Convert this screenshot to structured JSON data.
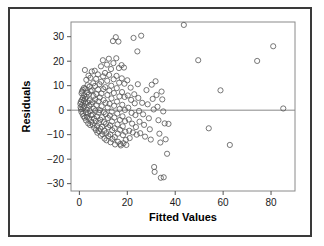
{
  "figure": {
    "frame_color": "#3a3a3a",
    "background": "#ffffff"
  },
  "chart_data": {
    "type": "scatter",
    "title": "",
    "xlabel": "Fitted Values",
    "ylabel": "Residuals",
    "xlim": [
      -3.5,
      90
    ],
    "ylim": [
      -33,
      36
    ],
    "xticks": [
      0,
      20,
      40,
      60,
      80
    ],
    "xtick_labels": [
      "0",
      "20",
      "40",
      "60",
      "80"
    ],
    "yticks": [
      -30,
      -20,
      -10,
      0,
      10,
      20,
      30
    ],
    "ytick_labels": [
      "−30",
      "−20",
      "−10",
      "0",
      "10",
      "20",
      "30"
    ],
    "grid": false,
    "legend": "none",
    "marker": "open-circle",
    "marker_color": "#555555",
    "marker_size": 2.6,
    "reference_line": {
      "orientation": "horizontal",
      "y": 0,
      "color": "#888888"
    },
    "points": [
      [
        0.4,
        2.6
      ],
      [
        0.5,
        1.2
      ],
      [
        0.6,
        3.4
      ],
      [
        0.7,
        0.4
      ],
      [
        0.8,
        -0.6
      ],
      [
        0.9,
        6.9
      ],
      [
        1.0,
        4.2
      ],
      [
        1.1,
        7.6
      ],
      [
        1.2,
        2.1
      ],
      [
        1.3,
        -1.5
      ],
      [
        1.4,
        8.3
      ],
      [
        1.5,
        5.0
      ],
      [
        1.6,
        0.8
      ],
      [
        1.7,
        -2.4
      ],
      [
        1.8,
        3.8
      ],
      [
        1.9,
        9.1
      ],
      [
        2.0,
        6.1
      ],
      [
        2.1,
        1.5
      ],
      [
        2.2,
        -3.1
      ],
      [
        2.3,
        16.4
      ],
      [
        2.4,
        4.6
      ],
      [
        2.5,
        8.8
      ],
      [
        2.6,
        2.9
      ],
      [
        2.7,
        -0.9
      ],
      [
        2.8,
        -4.2
      ],
      [
        2.9,
        12.4
      ],
      [
        3.0,
        5.5
      ],
      [
        3.1,
        0.2
      ],
      [
        3.2,
        -2.8
      ],
      [
        3.3,
        7.2
      ],
      [
        3.4,
        10.2
      ],
      [
        3.5,
        3.1
      ],
      [
        3.6,
        -1.2
      ],
      [
        3.7,
        -5.4
      ],
      [
        3.8,
        14.1
      ],
      [
        3.9,
        6.4
      ],
      [
        4.0,
        1.9
      ],
      [
        4.1,
        -3.6
      ],
      [
        4.2,
        9.6
      ],
      [
        4.3,
        4.0
      ],
      [
        4.4,
        -0.4
      ],
      [
        4.5,
        -6.1
      ],
      [
        4.6,
        13.2
      ],
      [
        4.7,
        7.8
      ],
      [
        4.8,
        2.4
      ],
      [
        4.9,
        -2.1
      ],
      [
        5.0,
        -4.8
      ],
      [
        5.2,
        15.8
      ],
      [
        5.3,
        8.1
      ],
      [
        5.4,
        3.3
      ],
      [
        5.5,
        -1.8
      ],
      [
        5.6,
        -5.9
      ],
      [
        5.8,
        11.0
      ],
      [
        5.9,
        5.8
      ],
      [
        6.0,
        0.6
      ],
      [
        6.1,
        -3.4
      ],
      [
        6.2,
        -7.2
      ],
      [
        6.4,
        16.1
      ],
      [
        6.5,
        9.9
      ],
      [
        6.6,
        4.4
      ],
      [
        6.7,
        -0.2
      ],
      [
        6.8,
        -4.4
      ],
      [
        6.9,
        -8.1
      ],
      [
        7.0,
        12.8
      ],
      [
        7.1,
        6.6
      ],
      [
        7.2,
        2.0
      ],
      [
        7.3,
        -2.6
      ],
      [
        7.4,
        -6.4
      ],
      [
        7.5,
        -9.2
      ],
      [
        7.7,
        14.6
      ],
      [
        7.8,
        8.4
      ],
      [
        7.9,
        3.6
      ],
      [
        8.0,
        -1.0
      ],
      [
        8.1,
        -5.2
      ],
      [
        8.2,
        -8.6
      ],
      [
        8.4,
        10.6
      ],
      [
        8.5,
        5.2
      ],
      [
        8.6,
        0.0
      ],
      [
        8.7,
        -3.9
      ],
      [
        8.8,
        -7.6
      ],
      [
        8.9,
        -10.4
      ],
      [
        9.0,
        17.9
      ],
      [
        9.1,
        11.6
      ],
      [
        9.2,
        6.8
      ],
      [
        9.3,
        1.6
      ],
      [
        9.4,
        -2.9
      ],
      [
        9.5,
        -6.8
      ],
      [
        9.6,
        -9.8
      ],
      [
        9.8,
        20.4
      ],
      [
        9.9,
        13.8
      ],
      [
        10.0,
        8.6
      ],
      [
        10.1,
        4.1
      ],
      [
        10.2,
        -0.8
      ],
      [
        10.3,
        -4.9
      ],
      [
        10.4,
        -8.4
      ],
      [
        10.5,
        -11.6
      ],
      [
        10.7,
        15.2
      ],
      [
        10.8,
        9.4
      ],
      [
        10.9,
        3.0
      ],
      [
        11.0,
        -1.6
      ],
      [
        11.1,
        -5.6
      ],
      [
        11.2,
        -9.4
      ],
      [
        11.3,
        -12.3
      ],
      [
        11.5,
        18.6
      ],
      [
        11.6,
        12.0
      ],
      [
        11.7,
        6.2
      ],
      [
        11.8,
        1.1
      ],
      [
        11.9,
        -3.2
      ],
      [
        12.0,
        -7.0
      ],
      [
        12.1,
        -10.6
      ],
      [
        12.3,
        21.0
      ],
      [
        12.4,
        14.4
      ],
      [
        12.5,
        8.0
      ],
      [
        12.6,
        2.6
      ],
      [
        12.7,
        -2.2
      ],
      [
        12.8,
        -6.2
      ],
      [
        12.9,
        -9.9
      ],
      [
        13.0,
        -13.1
      ],
      [
        13.2,
        16.8
      ],
      [
        13.3,
        10.0
      ],
      [
        13.4,
        4.8
      ],
      [
        13.5,
        -0.6
      ],
      [
        13.6,
        -4.6
      ],
      [
        13.7,
        -8.2
      ],
      [
        13.8,
        -11.8
      ],
      [
        14.0,
        28.2
      ],
      [
        14.2,
        19.2
      ],
      [
        14.3,
        12.6
      ],
      [
        14.4,
        7.0
      ],
      [
        14.5,
        1.8
      ],
      [
        14.6,
        -3.0
      ],
      [
        14.7,
        -7.4
      ],
      [
        14.8,
        -11.0
      ],
      [
        14.9,
        -14.0
      ],
      [
        15.2,
        29.8
      ],
      [
        15.4,
        21.2
      ],
      [
        15.5,
        14.0
      ],
      [
        15.6,
        9.0
      ],
      [
        15.7,
        3.5
      ],
      [
        15.8,
        -1.4
      ],
      [
        15.9,
        -5.8
      ],
      [
        16.0,
        -9.6
      ],
      [
        16.1,
        -12.9
      ],
      [
        16.3,
        28.0
      ],
      [
        16.5,
        17.2
      ],
      [
        16.6,
        11.2
      ],
      [
        16.7,
        5.6
      ],
      [
        16.8,
        0.5
      ],
      [
        16.9,
        -4.0
      ],
      [
        17.0,
        -8.0
      ],
      [
        17.1,
        -13.8
      ],
      [
        17.3,
        -14.4
      ],
      [
        17.6,
        18.4
      ],
      [
        17.7,
        13.0
      ],
      [
        17.8,
        7.4
      ],
      [
        17.9,
        2.2
      ],
      [
        18.0,
        -2.5
      ],
      [
        18.1,
        -6.6
      ],
      [
        18.2,
        -10.2
      ],
      [
        18.4,
        -13.5
      ],
      [
        18.6,
        17.4
      ],
      [
        18.8,
        10.8
      ],
      [
        18.9,
        5.4
      ],
      [
        19.0,
        0.1
      ],
      [
        19.1,
        -4.5
      ],
      [
        19.2,
        -8.8
      ],
      [
        19.4,
        -12.1
      ],
      [
        19.6,
        -14.2
      ],
      [
        20.0,
        12.2
      ],
      [
        20.2,
        6.0
      ],
      [
        20.4,
        1.0
      ],
      [
        20.6,
        -3.8
      ],
      [
        20.8,
        -8.4
      ],
      [
        21.0,
        -11.4
      ],
      [
        21.4,
        9.2
      ],
      [
        21.6,
        4.2
      ],
      [
        21.8,
        -1.1
      ],
      [
        22.0,
        -5.5
      ],
      [
        22.3,
        -9.1
      ],
      [
        22.6,
        29.5
      ],
      [
        22.9,
        6.5
      ],
      [
        23.1,
        2.8
      ],
      [
        23.4,
        -2.0
      ],
      [
        23.6,
        -6.9
      ],
      [
        23.9,
        -10.0
      ],
      [
        24.2,
        24.0
      ],
      [
        24.4,
        10.6
      ],
      [
        24.6,
        5.0
      ],
      [
        24.9,
        -0.3
      ],
      [
        25.1,
        -4.7
      ],
      [
        25.4,
        -9.4
      ],
      [
        25.8,
        30.4
      ],
      [
        26.2,
        3.0
      ],
      [
        26.6,
        -1.7
      ],
      [
        27.0,
        -6.0
      ],
      [
        27.4,
        -10.8
      ],
      [
        28.0,
        8.2
      ],
      [
        28.5,
        2.4
      ],
      [
        29.0,
        -3.3
      ],
      [
        29.4,
        -7.8
      ],
      [
        29.8,
        -12.0
      ],
      [
        30.2,
        10.4
      ],
      [
        30.6,
        4.6
      ],
      [
        31.0,
        0.3
      ],
      [
        31.2,
        -23.2
      ],
      [
        31.4,
        -25.2
      ],
      [
        31.8,
        11.8
      ],
      [
        32.2,
        6.2
      ],
      [
        32.6,
        1.4
      ],
      [
        33.0,
        -4.1
      ],
      [
        33.4,
        -9.6
      ],
      [
        33.8,
        -13.2
      ],
      [
        34.0,
        -27.6
      ],
      [
        34.3,
        7.6
      ],
      [
        34.6,
        4.4
      ],
      [
        35.0,
        -0.5
      ],
      [
        35.2,
        -27.4
      ],
      [
        35.6,
        -5.4
      ],
      [
        36.0,
        -11.9
      ],
      [
        36.6,
        -17.8
      ],
      [
        37.2,
        -5.6
      ],
      [
        43.6,
        34.8
      ],
      [
        49.6,
        20.4
      ],
      [
        54.0,
        -7.4
      ],
      [
        58.9,
        8.1
      ],
      [
        62.8,
        -14.2
      ],
      [
        74.2,
        20.1
      ],
      [
        80.9,
        26.1
      ],
      [
        85.1,
        0.7
      ]
    ]
  }
}
